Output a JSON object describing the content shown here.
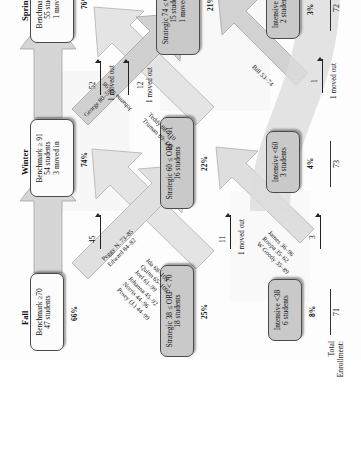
{
  "diagram": {
    "type": "student-reading-benchmark-flow",
    "total_enrollment_label_line1": "Total",
    "total_enrollment_label_line2": "Enrollment:",
    "columns": [
      {
        "id": "fall",
        "header": "Fall",
        "total_enrollment": "71",
        "nodes": [
          {
            "id": "fall-benchmark",
            "tier": "benchmark",
            "shade": "white",
            "lines": [
              "Benchmark ≥70",
              "47 students"
            ],
            "pct": "66%"
          },
          {
            "id": "fall-strategic",
            "tier": "strategic",
            "shade": "grey",
            "lines": [
              "Strategic 38 ≤ ORF < 70",
              "18 students"
            ],
            "pct": "25%"
          },
          {
            "id": "fall-intensive",
            "tier": "intensive",
            "shade": "grey",
            "lines": [
              "Intensive <38",
              "6 students"
            ],
            "pct": "8%"
          }
        ]
      },
      {
        "id": "winter",
        "header": "Winter",
        "total_enrollment": "73",
        "nodes": [
          {
            "id": "winter-benchmark",
            "tier": "benchmark",
            "shade": "white",
            "lines": [
              "Benchmark ≥ 91",
              "54 students",
              "3 moved in"
            ],
            "pct": "74%"
          },
          {
            "id": "winter-strategic",
            "tier": "strategic",
            "shade": "grey",
            "lines": [
              "Strategic 60 ≤ ORF < 91",
              "16 students"
            ],
            "pct": "22%"
          },
          {
            "id": "winter-intensive",
            "tier": "intensive",
            "shade": "grey",
            "lines": [
              "Intensive <60",
              "3 students"
            ],
            "pct": "4%"
          }
        ]
      },
      {
        "id": "spring",
        "header": "Spring",
        "total_enrollment": "72",
        "nodes": [
          {
            "id": "spring-benchmark",
            "tier": "benchmark",
            "shade": "white",
            "lines": [
              "Benchmark ≥ 107",
              "55 students",
              "1 moved in"
            ],
            "pct": "76%"
          },
          {
            "id": "spring-strategic",
            "tier": "strategic",
            "shade": "grey",
            "lines": [
              "Strategic 74 ≤ ORF < 107",
              "15 students",
              "1 moved in"
            ],
            "pct": "21%"
          },
          {
            "id": "spring-intensive",
            "tier": "intensive",
            "shade": "grey",
            "lines": [
              "Intensive <74",
              "2 students"
            ],
            "pct": "3%"
          }
        ]
      }
    ],
    "flow_counts": [
      {
        "id": "fall-bench-to-winter-bench",
        "count": "45",
        "moved_out": ""
      },
      {
        "id": "fall-strat-to-winter",
        "count": "11",
        "moved_out": "1 moved out"
      },
      {
        "id": "fall-intensive-to-winter",
        "count": "3",
        "moved_out": ""
      },
      {
        "id": "winter-bench-to-spring-bench",
        "count": "52",
        "moved_out": "1 moved out"
      },
      {
        "id": "winter-strat-to-spring",
        "count": "12",
        "moved_out": "1 moved out"
      },
      {
        "id": "winter-intensive-to-spring",
        "count": "1",
        "moved_out": "1 moved out"
      }
    ],
    "name_lists": [
      {
        "id": "fall-strategic-up-to-winter-benchmark",
        "entries": [
          "Ida 68–109",
          "Quinn 65–100",
          "Joel 61–99",
          "Johanna 45–92",
          "Norris 44–96",
          "Posey (J.) 44–99"
        ]
      },
      {
        "id": "fall-benchmark-down-to-winter-strategic",
        "entries": [
          "Peggy N. 73–85",
          "Edward 84–82"
        ]
      },
      {
        "id": "fall-intensive-up-to-winter-strategic",
        "entries": [
          "James 36–96",
          "Roopa 35–62",
          "W Goody 35–89"
        ]
      },
      {
        "id": "winter-strategic-up-to-spring-benchmark",
        "entries": [
          "Teddy 88–110",
          "Truman 89–145"
        ]
      },
      {
        "id": "winter-strategic-up-to-spring-strategic",
        "entries": [
          "Johanna 92–98"
        ]
      },
      {
        "id": "winter-benchmark-down-to-spring-strategic",
        "entries": [
          "George 80–59"
        ]
      },
      {
        "id": "winter-intensive-up-to-spring-strategic",
        "entries": [
          "Bill 53–74"
        ]
      }
    ],
    "colors": {
      "node_white": "#fcfcfc",
      "node_grey": "#c9c9c9",
      "band_grey": "#cfcfcf",
      "band_light": "#f4f4f4",
      "stroke": "#4a4a4a"
    }
  }
}
